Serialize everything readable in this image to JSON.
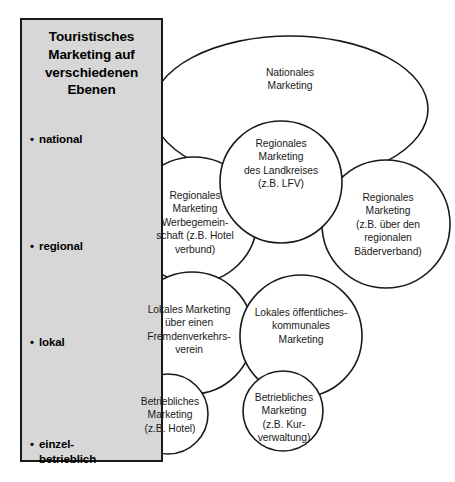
{
  "figure": {
    "title": "Touristisches Marketing auf verschiedenen Ebenen"
  },
  "panel": {
    "title_lines": "Touristisches\nMarketing auf\nverschiedenen\nEbenen",
    "title_line_1": "Touristisches",
    "title_line_2": "Marketing auf",
    "title_line_3": "verschiedenen",
    "title_line_4": "Ebenen",
    "levels": [
      {
        "key": "national",
        "label": "national"
      },
      {
        "key": "regional",
        "label": "regional"
      },
      {
        "key": "lokal",
        "label": "lokal"
      },
      {
        "key": "einzelbetrieblich",
        "label": "einzel-\nbetrieblich"
      }
    ],
    "background_color": "#d7d7d7",
    "border_color": "#1a1a1a"
  },
  "nodes": {
    "national": {
      "label": "Nationales\nMarketing",
      "level": "national",
      "shape": "ellipse"
    },
    "landkreis": {
      "label": "Regionales\nMarketing\ndes Landkreises\n(z.B. LFV)",
      "level": "regional",
      "shape": "circle"
    },
    "werbegemeinschaft": {
      "label": "Regionales\nMarketing\nWerbegemein-\nschaft (z.B. Hotel\nverbund)",
      "level": "regional",
      "shape": "circle"
    },
    "baederverband": {
      "label": "Regionales\nMarketing\n(z.B. über den\nregionalen\nBäderverband)",
      "level": "regional",
      "shape": "circle"
    },
    "fremdenverkehrsverein": {
      "label": "Lokales Marketing\nüber einen\nFremdenverkehrs-\nverein",
      "level": "lokal",
      "shape": "circle"
    },
    "kommunal": {
      "label": "Lokales öffentliches-\nkommunales\nMarketing",
      "level": "lokal",
      "shape": "circle"
    },
    "betrieb_hotel": {
      "label": "Betriebliches\nMarketing\n(z.B. Hotel)",
      "level": "einzelbetrieblich",
      "shape": "circle"
    },
    "betrieb_kurverwaltung": {
      "label": "Betriebliches\nMarketing\n(z.B. Kur-\nverwaltung)",
      "level": "einzelbetrieblich",
      "shape": "circle"
    }
  },
  "style": {
    "stroke_color": "#1a1a1a",
    "fill_color": "#ffffff",
    "page_background": "#ffffff"
  }
}
